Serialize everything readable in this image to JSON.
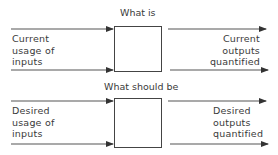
{
  "colors": {
    "line": "#444444",
    "text": "#3a3a3a",
    "background": "#ffffff"
  },
  "top_section": {
    "title": "What is",
    "input_label": [
      "Current",
      "usage of",
      "inputs"
    ],
    "output_label": [
      "Current",
      "outputs",
      "quantified"
    ],
    "box": "process-box"
  },
  "bottom_section": {
    "title": "What should be",
    "input_label": [
      "Desired",
      "usage of",
      "inputs"
    ],
    "output_label": [
      "Desired",
      "outputs",
      "quantified"
    ],
    "box": "process-box"
  }
}
